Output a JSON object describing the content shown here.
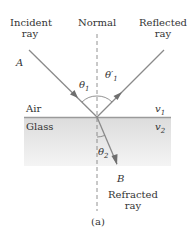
{
  "figure": {
    "caption": "(a)",
    "labels": {
      "incident": [
        "Incident",
        "ray"
      ],
      "normal": "Normal",
      "reflected": [
        "Reflected",
        "ray"
      ],
      "refracted": [
        "Refracted",
        "ray"
      ],
      "point_a": "A",
      "point_b": "B",
      "theta1": "θ",
      "theta1_sub": "1",
      "theta1p": "θ′",
      "theta1p_sub": "1",
      "theta2": "θ",
      "theta2_sub": "2",
      "medium_top": "Air",
      "medium_bottom": "Glass",
      "v1": "v",
      "v1_sub": "1",
      "v2": "v",
      "v2_sub": "2"
    },
    "colors": {
      "ray": "#8a8a8a",
      "arrow": "#6f6f6f",
      "interface": "#9a9a9a",
      "glass_top": "#dedede",
      "glass_bottom": "#f3f3f3",
      "normal": "#777777",
      "text": "#333333"
    }
  }
}
